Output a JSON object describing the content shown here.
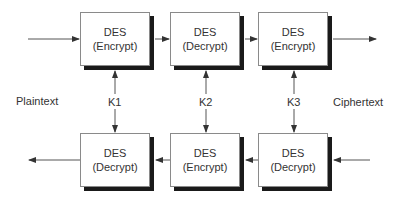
{
  "diagram": {
    "top_row": [
      {
        "name": "DES",
        "op": "(Encrypt)"
      },
      {
        "name": "DES",
        "op": "(Decrypt)"
      },
      {
        "name": "DES",
        "op": "(Encrypt)"
      }
    ],
    "bottom_row": [
      {
        "name": "DES",
        "op": "(Decrypt)"
      },
      {
        "name": "DES",
        "op": "(Encrypt)"
      },
      {
        "name": "DES",
        "op": "(Decrypt)"
      }
    ],
    "keys": [
      "K1",
      "K2",
      "K3"
    ],
    "left_label": "Plaintext",
    "right_label": "Ciphertext"
  }
}
